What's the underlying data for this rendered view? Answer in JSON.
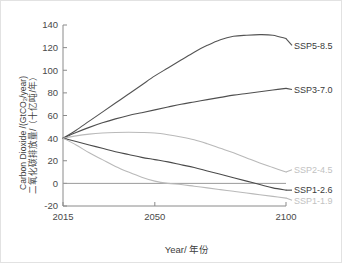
{
  "figure": {
    "background": "#ffffff",
    "border_color": "#e2e2e2"
  },
  "chart_data": {
    "type": "line",
    "title": "",
    "xlabel": "Year/ 年份",
    "ylabel_en": "Carbon Dioxide /(GtCO₂/year)",
    "ylabel_zh": "二氧化碳排放量/（十亿吨/年）",
    "xlim": [
      2015,
      2100
    ],
    "ylim": [
      -20,
      140
    ],
    "xticks": [
      2015,
      2050,
      2100
    ],
    "xtick_labels": [
      "2015",
      "2050",
      "2100"
    ],
    "yticks": [
      -20,
      0,
      20,
      40,
      60,
      80,
      100,
      120,
      140
    ],
    "ytick_labels": [
      "-20",
      "0",
      "20",
      "40",
      "60",
      "80",
      "100",
      "120",
      "140"
    ],
    "grid": false,
    "legend_position": "right-inline-labels",
    "zero_line": true,
    "x": [
      2015,
      2020,
      2025,
      2030,
      2035,
      2040,
      2045,
      2050,
      2055,
      2060,
      2065,
      2070,
      2075,
      2080,
      2085,
      2090,
      2095,
      2100
    ],
    "series": [
      {
        "name": "SSP5-8.5",
        "color": "#545454",
        "label_color": "#3a3a3a",
        "label_x": 2101,
        "label_y": 122,
        "values": [
          40,
          47,
          55,
          63,
          71,
          79,
          87,
          95,
          102,
          109,
          116,
          122,
          127,
          130,
          131,
          131.5,
          131,
          128
        ]
      },
      {
        "name": "SSP3-7.0",
        "color": "#4f4f4f",
        "label_color": "#3a3a3a",
        "label_x": 2101,
        "label_y": 83,
        "values": [
          40,
          45,
          49.5,
          53.5,
          57,
          60,
          62.5,
          65,
          67.5,
          70,
          72,
          74,
          76,
          78,
          79.5,
          81,
          82.5,
          84
        ]
      },
      {
        "name": "SSP2-4.5",
        "color": "#b9b9b9",
        "label_color": "#c2c2c2",
        "label_x": 2101,
        "label_y": 12,
        "values": [
          40,
          42,
          43.5,
          44.5,
          45,
          45.2,
          45,
          44.5,
          43,
          41,
          38.5,
          35,
          31,
          27,
          22.5,
          18,
          14,
          10
        ]
      },
      {
        "name": "SSP1-2.6",
        "color": "#4a4a4a",
        "label_color": "#3a3a3a",
        "label_x": 2101,
        "label_y": -6,
        "values": [
          40,
          37,
          34,
          31,
          28,
          25.5,
          23,
          21,
          19,
          16.5,
          14,
          11,
          8,
          5,
          2,
          -1,
          -4,
          -6
        ]
      },
      {
        "name": "SSP1-1.9",
        "color": "#b9b9b9",
        "label_color": "#c2c2c2",
        "label_x": 2101,
        "label_y": -15,
        "values": [
          40,
          34,
          27,
          21,
          15,
          10,
          5.5,
          2,
          0,
          -1,
          -2.5,
          -4,
          -5.5,
          -7,
          -8.5,
          -10,
          -11.5,
          -13
        ]
      }
    ]
  }
}
